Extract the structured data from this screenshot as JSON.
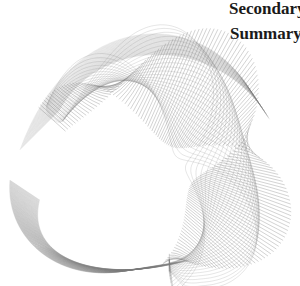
{
  "labels": {
    "secondary": "Secondary",
    "summary": "Summary"
  },
  "artwork": {
    "icon": "twisted-wireframe-ribbon",
    "stroke_color": "#7a7a7a",
    "background": "#ffffff"
  }
}
